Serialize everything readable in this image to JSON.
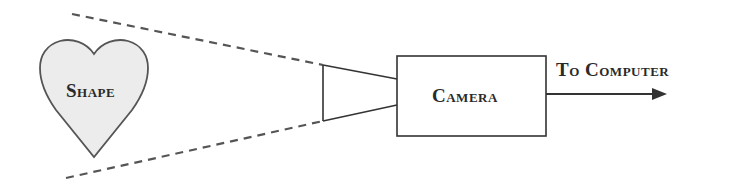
{
  "diagram": {
    "nodes": {
      "shape": {
        "label": "Shape",
        "kind": "heart"
      },
      "camera": {
        "label": "Camera",
        "kind": "box"
      },
      "output": {
        "label": "To Computer",
        "kind": "arrow-target"
      }
    },
    "edges": [
      {
        "from": "camera",
        "to": "output",
        "style": "arrow"
      }
    ],
    "field_of_view": {
      "style": "dashed",
      "from": "camera-lens",
      "toward": "shape"
    }
  },
  "colors": {
    "stroke": "#333333",
    "dashed": "#555555",
    "heart_fill": "#ececec",
    "background": "#ffffff"
  }
}
